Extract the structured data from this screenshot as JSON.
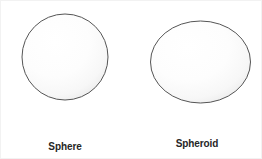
{
  "figure": {
    "background_color": "#ffffff",
    "width": 262,
    "height": 159,
    "border_color": "#f2f2f2"
  },
  "style": {
    "shape_outline_color": "#555555",
    "shape_fill_light": "#ffffff",
    "shape_fill_shadow": "#e8e8e8",
    "caption_color": "#262626"
  },
  "shapes": [
    {
      "id": "sphere",
      "kind": "circle",
      "caption_lines": [
        "Sphere"
      ],
      "geometry": {
        "center_x": 63,
        "center_y": 56,
        "radius": 43
      }
    },
    {
      "id": "spheroid",
      "kind": "ellipse",
      "caption_lines": [
        "Spheroid",
        "(Ellipsoid)"
      ],
      "geometry": {
        "center_x": 199,
        "center_y": 60,
        "radius_x": 50,
        "radius_y": 41
      }
    }
  ]
}
